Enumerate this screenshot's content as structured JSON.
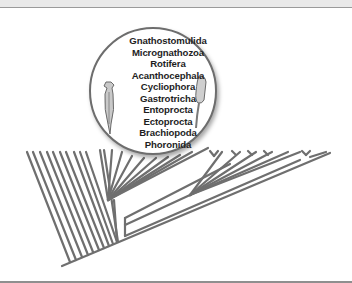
{
  "figure": {
    "type": "phylogenetic-tree-with-magnified-clade",
    "lens": {
      "title": "Lophotrochozoa clade detail",
      "taxa": [
        "Gnathostomulida",
        "Micrognathozoa",
        "Rotifera",
        "Acanthocephala",
        "Cycliophora",
        "Gastrotricha",
        "Entoprocta",
        "Ectoprocta",
        "Brachiopoda",
        "Phoronida"
      ],
      "illustrations": [
        "rotifer-illustration",
        "cycliophoran-illustration"
      ]
    },
    "colors": {
      "branch": "#6f6f6f",
      "lens_border": "#6d6d6d",
      "text": "#1e1e1e",
      "frame": "#e9e9e9"
    }
  }
}
